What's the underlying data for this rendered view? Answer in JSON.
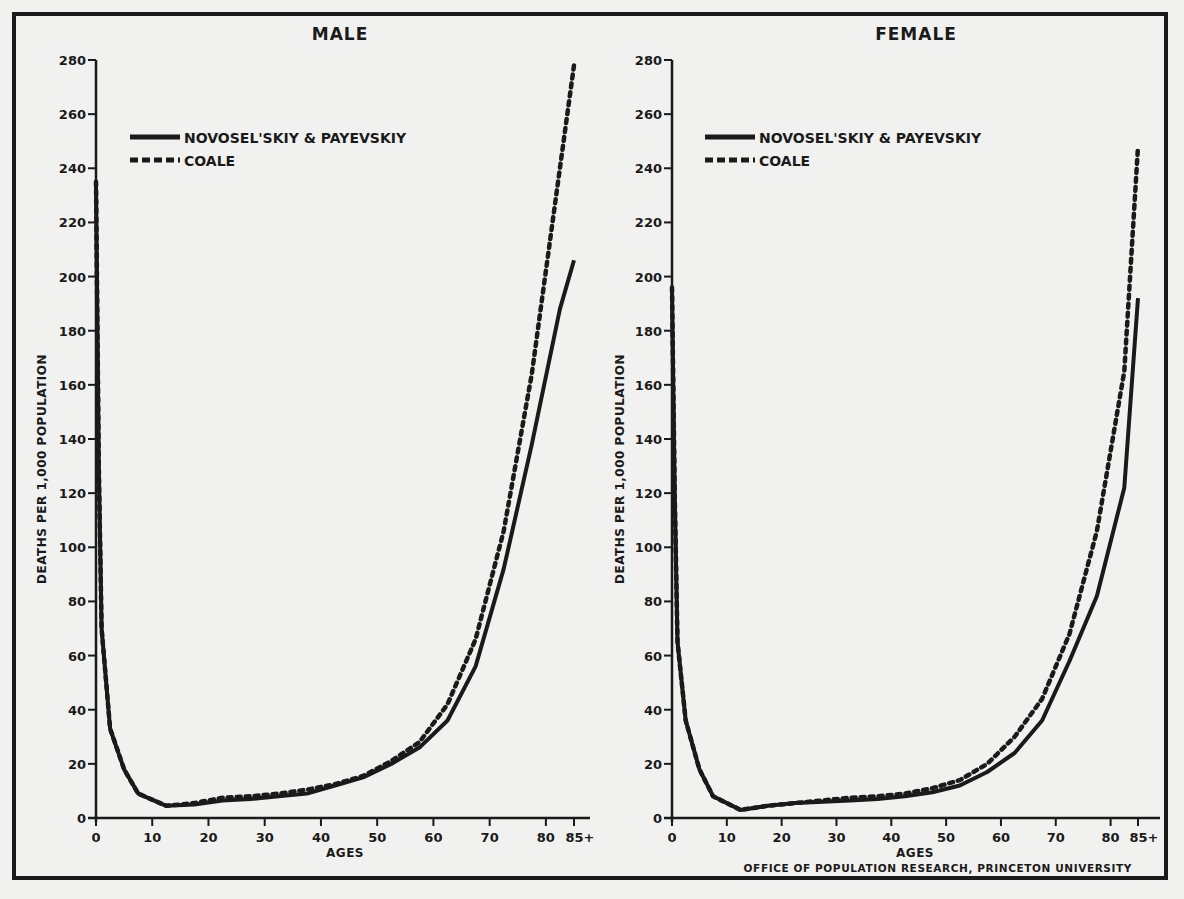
{
  "credit": "OFFICE OF POPULATION RESEARCH, PRINCETON UNIVERSITY",
  "colors": {
    "ink": "#1a1a1a",
    "paper": "#f1f1ef"
  },
  "chart_data": [
    {
      "type": "line",
      "title": "MALE",
      "xlabel": "AGES",
      "ylabel": "DEATHS PER 1,000 POPULATION",
      "xlim": [
        0,
        85
      ],
      "ylim": [
        0,
        280
      ],
      "x_ticks": [
        0,
        10,
        20,
        30,
        40,
        50,
        60,
        70,
        80,
        85
      ],
      "x_tick_labels": [
        "0",
        "10",
        "20",
        "30",
        "40",
        "50",
        "60",
        "70",
        "80",
        "85+"
      ],
      "y_ticks": [
        0,
        20,
        40,
        60,
        80,
        100,
        120,
        140,
        160,
        180,
        200,
        220,
        240,
        260,
        280
      ],
      "grid": false,
      "legend": "top-left",
      "series": [
        {
          "name": "NOVOSEL'SKIY & PAYEVSKIY",
          "style": "solid",
          "x": [
            0,
            0.5,
            1,
            2.5,
            5,
            7.5,
            12.5,
            17.5,
            22.5,
            27.5,
            32.5,
            37.5,
            42.5,
            47.5,
            52.5,
            57.5,
            62.5,
            67.5,
            72.5,
            77.5,
            82.5,
            85
          ],
          "y": [
            235,
            130,
            70,
            33,
            18,
            9,
            4.5,
            5,
            6.5,
            7,
            8,
            9,
            12,
            15,
            20,
            26,
            36,
            56,
            92,
            138,
            188,
            206
          ]
        },
        {
          "name": "COALE",
          "style": "dashed",
          "x": [
            0,
            0.5,
            1,
            2.5,
            5,
            7.5,
            12.5,
            17.5,
            22.5,
            27.5,
            32.5,
            37.5,
            42.5,
            47.5,
            52.5,
            57.5,
            62.5,
            67.5,
            72.5,
            77.5,
            82.5,
            85
          ],
          "y": [
            235,
            130,
            70,
            33,
            18,
            9,
            4.5,
            5.5,
            7.5,
            8,
            9,
            10.5,
            12.5,
            15.5,
            21,
            28,
            42,
            66,
            106,
            164,
            240,
            278
          ]
        }
      ]
    },
    {
      "type": "line",
      "title": "FEMALE",
      "xlabel": "AGES",
      "ylabel": "DEATHS PER 1,000 POPULATION",
      "xlim": [
        0,
        85
      ],
      "ylim": [
        0,
        280
      ],
      "x_ticks": [
        0,
        10,
        20,
        30,
        40,
        50,
        60,
        70,
        80,
        85
      ],
      "x_tick_labels": [
        "0",
        "10",
        "20",
        "30",
        "40",
        "50",
        "60",
        "70",
        "80",
        "85+"
      ],
      "y_ticks": [
        0,
        20,
        40,
        60,
        80,
        100,
        120,
        140,
        160,
        180,
        200,
        220,
        240,
        260,
        280
      ],
      "grid": false,
      "legend": "top-left",
      "series": [
        {
          "name": "NOVOSEL'SKIY & PAYEVSKIY",
          "style": "solid",
          "x": [
            0,
            0.5,
            1,
            2.5,
            5,
            7.5,
            12.5,
            17.5,
            22.5,
            27.5,
            32.5,
            37.5,
            42.5,
            47.5,
            52.5,
            57.5,
            62.5,
            67.5,
            72.5,
            77.5,
            82.5,
            85
          ],
          "y": [
            196,
            120,
            65,
            36,
            18,
            8,
            3,
            4.5,
            5.5,
            6,
            6.5,
            7,
            8,
            9.5,
            12,
            17,
            24,
            36,
            58,
            82,
            122,
            192
          ]
        },
        {
          "name": "COALE",
          "style": "dashed",
          "x": [
            0,
            0.5,
            1,
            2.5,
            5,
            7.5,
            12.5,
            17.5,
            22.5,
            27.5,
            32.5,
            37.5,
            42.5,
            47.5,
            52.5,
            57.5,
            62.5,
            67.5,
            72.5,
            77.5,
            82.5,
            85
          ],
          "y": [
            196,
            120,
            65,
            36,
            18,
            8,
            3,
            4.5,
            5.5,
            6.5,
            7.5,
            8,
            9,
            11,
            14,
            20,
            30,
            44,
            68,
            106,
            165,
            248
          ]
        }
      ]
    }
  ]
}
